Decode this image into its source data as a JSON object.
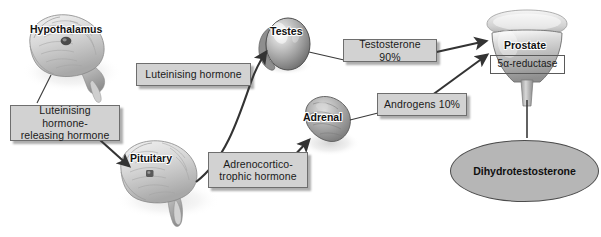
{
  "diagram": {
    "background_color": "#ffffff",
    "box_fill": "#d2d2d2",
    "box_border": "#6e6e6e",
    "ellipse_fill": "#b6b6b6",
    "arrow_color": "#333333"
  },
  "organs": [
    {
      "id": "hypothalamus",
      "label": "Hypothalamus"
    },
    {
      "id": "pituitary",
      "label": "Pituitary"
    },
    {
      "id": "testes",
      "label": "Testes"
    },
    {
      "id": "adrenal",
      "label": "Adrenal"
    },
    {
      "id": "prostate",
      "label": "Prostate"
    }
  ],
  "labels": {
    "lhrh": "Luteinising hormone-\nreleasing hormone",
    "lh": "Luteinising hormone",
    "acth": "Adrenocortico-\ntrophic hormone",
    "testosterone": "Testosterone 90%",
    "androgens": "Androgens 10%",
    "reductase": "5α-reductase"
  },
  "nodes": {
    "dht": "Dihydrotestosterone"
  }
}
